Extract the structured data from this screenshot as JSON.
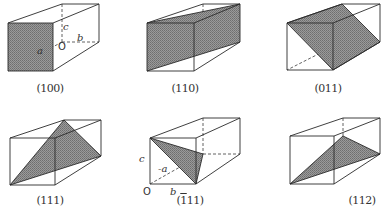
{
  "figure": {
    "plane_color": "#8a8a8a",
    "edge_color": "#2a2a2a",
    "panels": [
      {
        "caption_open": "(",
        "caption_bar": "",
        "caption_rest": "100",
        "caption_close": ")",
        "labels": {
          "a": "a",
          "b": "b",
          "c": "c",
          "origin": "O"
        }
      },
      {
        "caption_open": "(",
        "caption_bar": "",
        "caption_rest": "110",
        "caption_close": ")"
      },
      {
        "caption_open": "(",
        "caption_bar": "",
        "caption_rest": "011",
        "caption_close": ")"
      },
      {
        "caption_open": "(",
        "caption_bar": "",
        "caption_rest": "111",
        "caption_close": ")"
      },
      {
        "caption_open": "(",
        "caption_bar": "1",
        "caption_rest": "11",
        "caption_close": ")",
        "labels": {
          "a": "-a",
          "b": "b",
          "c": "c",
          "origin": "O"
        }
      },
      {
        "caption_open": "(",
        "caption_bar": "",
        "caption_rest": "112",
        "caption_close": ")"
      }
    ]
  }
}
